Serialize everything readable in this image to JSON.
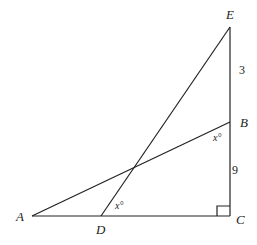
{
  "diagram": {
    "type": "geometry-figure",
    "points": {
      "A": {
        "label": "A",
        "x": 32,
        "y": 216
      },
      "B": {
        "label": "B",
        "x": 230,
        "y": 122
      },
      "C": {
        "label": "C",
        "x": 230,
        "y": 216
      },
      "D": {
        "label": "D",
        "x": 101,
        "y": 216
      },
      "E": {
        "label": "E",
        "x": 230,
        "y": 27
      }
    },
    "segments": [
      {
        "from": "A",
        "to": "C"
      },
      {
        "from": "E",
        "to": "C"
      },
      {
        "from": "A",
        "to": "B"
      },
      {
        "from": "D",
        "to": "E"
      }
    ],
    "lengths": {
      "EB": "3",
      "BC": "9"
    },
    "angles": {
      "at_B": "x°",
      "at_D": "x°"
    },
    "right_angle_at": "C"
  }
}
